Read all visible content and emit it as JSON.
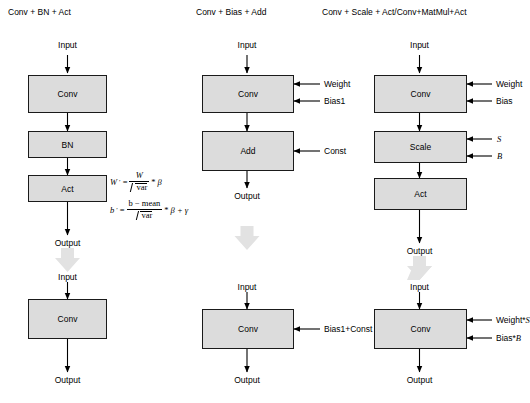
{
  "diagram": {
    "title_visible": false,
    "background": "#ffffff",
    "node_fill": "#dcdcdc",
    "node_stroke": "#1a1a1a",
    "transform_arrow_color": "#e4e4e4"
  },
  "columns": [
    {
      "id": "col-bn",
      "title": "Conv + BN + Act",
      "before": {
        "input_label": "Input",
        "output_label": "Output",
        "nodes": [
          {
            "label": "Conv"
          },
          {
            "label": "BN"
          },
          {
            "label": "Act"
          }
        ],
        "side_inputs": []
      },
      "after": {
        "input_label": "Input",
        "output_label": "Output",
        "nodes": [
          {
            "label": "Conv"
          }
        ],
        "side_inputs": []
      }
    },
    {
      "id": "col-bias-add",
      "title": "Conv + Bias + Add",
      "before": {
        "input_label": "Input",
        "output_label": "Output",
        "nodes": [
          {
            "label": "Conv"
          },
          {
            "label": "Add"
          }
        ],
        "side_inputs": [
          {
            "label": "Weight",
            "target": "Conv"
          },
          {
            "label": "Bias1",
            "target": "Conv"
          },
          {
            "label": "Const",
            "target": "Add"
          }
        ]
      },
      "after": {
        "input_label": "Input",
        "output_label": "Output",
        "nodes": [
          {
            "label": "Conv"
          }
        ],
        "side_inputs": [
          {
            "label": "Bias1+Const",
            "target": "Conv"
          }
        ]
      }
    },
    {
      "id": "col-scale-act",
      "title": "Conv + Scale + Act/Conv+MatMul+Act",
      "before": {
        "input_label": "Input",
        "output_label": "Output",
        "nodes": [
          {
            "label": "Conv"
          },
          {
            "label": "Scale"
          },
          {
            "label": "Act"
          }
        ],
        "side_inputs": [
          {
            "label": "Weight",
            "target": "Conv"
          },
          {
            "label": "Bias",
            "target": "Conv"
          },
          {
            "label": "S",
            "target": "Scale",
            "italic": true
          },
          {
            "label": "B",
            "target": "Scale",
            "italic": true
          }
        ]
      },
      "after": {
        "input_label": "Input",
        "output_label": "Output",
        "nodes": [
          {
            "label": "Conv"
          }
        ],
        "side_inputs": [
          {
            "label_plain": "Weight*",
            "label_italic": "S",
            "target": "Conv"
          },
          {
            "label_plain": "Bias*",
            "label_italic": "B",
            "target": "Conv"
          }
        ]
      }
    }
  ],
  "formulas": [
    {
      "id": "weight-formula",
      "lhs": "W",
      "lhs_prime": "′",
      "eq": "=",
      "numerator": "W",
      "denominator": "var",
      "denominator_radical": true,
      "operator": "*",
      "rhs": "β",
      "plain_text": "W' = W / √var * β"
    },
    {
      "id": "bias-formula",
      "lhs": "b",
      "lhs_prime": "′",
      "eq": "=",
      "numerator": "b − mean",
      "denominator": "var",
      "denominator_radical": true,
      "operator": "*",
      "rhs": "β + γ",
      "plain_text": "b' = (b − mean) / √var * β + γ"
    }
  ]
}
